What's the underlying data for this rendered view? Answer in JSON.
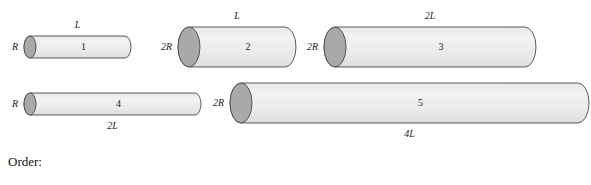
{
  "figure": {
    "caption": "Five cylinders of varying radius and length, drawn in 3-D with shaded circular end caps",
    "colors": {
      "body_fill": "#e9e9e7",
      "body_fill_light": "#f2f2f0",
      "cap_fill": "#a9a9a7",
      "outline": "#4a4a4a",
      "text": "#1d1d1d",
      "background": "#ffffff"
    },
    "cylinders": [
      {
        "index_label": "1",
        "radius_label": "R",
        "length_label": "L",
        "length_label_position": "top",
        "x": 30,
        "y": 36,
        "length_px": 95,
        "radius_px": 11,
        "cap_rx": 6
      },
      {
        "index_label": "2",
        "radius_label": "2R",
        "length_label": "L",
        "length_label_position": "top",
        "x": 189,
        "y": 27,
        "length_px": 96,
        "radius_px": 20,
        "cap_rx": 11
      },
      {
        "index_label": "3",
        "radius_label": "2R",
        "length_label": "2L",
        "length_label_position": "top",
        "x": 335,
        "y": 27,
        "length_px": 190,
        "radius_px": 20,
        "cap_rx": 11
      },
      {
        "index_label": "4",
        "radius_label": "R",
        "length_label": "2L",
        "length_label_position": "bottom",
        "x": 30,
        "y": 93,
        "length_px": 165,
        "radius_px": 11,
        "cap_rx": 6
      },
      {
        "index_label": "5",
        "radius_label": "2R",
        "length_label": "4L",
        "length_label_position": "bottom",
        "x": 241,
        "y": 83,
        "length_px": 337,
        "radius_px": 20,
        "cap_rx": 11
      }
    ]
  },
  "prompt": {
    "order_label": "Order:"
  }
}
